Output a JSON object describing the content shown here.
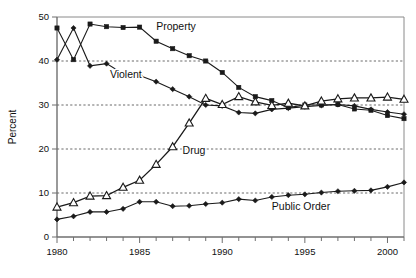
{
  "chart_data": {
    "type": "line",
    "title": "",
    "xlabel": "",
    "ylabel": "Percent",
    "xlim": [
      1980,
      2001
    ],
    "ylim": [
      0,
      50
    ],
    "ytick_labels": [
      "0",
      "10",
      "20",
      "30",
      "40",
      "50"
    ],
    "yticks": [
      0,
      10,
      20,
      30,
      40,
      50
    ],
    "xtick_labels": [
      "1980",
      "1985",
      "1990",
      "1995",
      "2000"
    ],
    "xticks": [
      1980,
      1985,
      1990,
      1995,
      2000
    ],
    "xminor_step": 1,
    "grid": "horizontal-dashed",
    "legend": "inline-labels",
    "x": [
      1980,
      1981,
      1982,
      1983,
      1984,
      1985,
      1986,
      1987,
      1988,
      1989,
      1990,
      1991,
      1992,
      1993,
      1994,
      1995,
      1996,
      1997,
      1998,
      1999,
      2000,
      2001
    ],
    "series": [
      {
        "name": "Property",
        "marker": "square",
        "label": "Property",
        "label_x": 1986.0,
        "label_y": 47.0,
        "values": [
          47.5,
          40.3,
          48.4,
          47.8,
          47.6,
          47.7,
          44.5,
          42.8,
          41.2,
          40.0,
          37.4,
          34.0,
          31.9,
          31.0,
          29.4,
          30.0,
          30.0,
          30.1,
          29.1,
          28.8,
          27.6,
          26.9
        ]
      },
      {
        "name": "Violent",
        "marker": "diamond",
        "label": "Violent",
        "label_x": 1983.2,
        "label_y": 36.2,
        "values": [
          40.3,
          47.5,
          38.9,
          39.4,
          37.1,
          36.7,
          35.3,
          33.6,
          31.9,
          30.0,
          29.8,
          28.3,
          28.1,
          29.0,
          29.3,
          29.6,
          29.9,
          30.1,
          29.8,
          29.0,
          28.4,
          27.9
        ]
      },
      {
        "name": "Drug",
        "marker": "triangle",
        "label": "Drug",
        "label_x": 1987.6,
        "label_y": 18.8,
        "values": [
          6.8,
          7.8,
          9.3,
          9.4,
          11.3,
          12.9,
          16.5,
          20.5,
          25.9,
          31.5,
          30.1,
          31.9,
          30.7,
          29.9,
          30.4,
          29.8,
          30.9,
          31.4,
          31.6,
          31.6,
          31.8,
          31.3
        ]
      },
      {
        "name": "Public Order",
        "marker": "diamond",
        "label": "Public Order",
        "label_x": 1993.0,
        "label_y": 6.1,
        "values": [
          4.0,
          4.7,
          5.7,
          5.7,
          6.4,
          8.0,
          8.0,
          7.0,
          7.1,
          7.5,
          7.8,
          8.6,
          8.3,
          9.1,
          9.5,
          9.7,
          10.1,
          10.4,
          10.5,
          10.6,
          11.4,
          12.4
        ]
      }
    ]
  },
  "colors": {
    "ink": "#1a1a1a",
    "axis": "#6f6f6f",
    "grid": "#444444",
    "background": "#ffffff"
  }
}
